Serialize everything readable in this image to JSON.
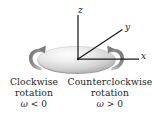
{
  "figure": {
    "background_color": "#ffffff",
    "width": 154,
    "height": 119
  },
  "diagram": {
    "disk": {
      "name": "rotating-disk",
      "fill_light": "#fbfbfb",
      "fill_mid": "#d8d8d8",
      "fill_dark": "#9a9a9a",
      "shadow_color": "#b4b4b4"
    },
    "axes": [
      {
        "id": "z",
        "label": "z",
        "direction": "up"
      },
      {
        "id": "y",
        "label": "y",
        "direction": "up-right"
      },
      {
        "id": "x",
        "label": "x",
        "direction": "right"
      }
    ],
    "axis_color": "#1a1a1a",
    "arrows": [
      {
        "id": "left",
        "name": "clockwise-rotation-arrow",
        "color": "#8c8c8c"
      },
      {
        "id": "right",
        "name": "counterclockwise-rotation-arrow",
        "color": "#8c8c8c"
      }
    ]
  },
  "caption": {
    "clockwise": {
      "line1": "Clockwise",
      "line2": "rotation",
      "symbol": "ω",
      "relation": "<",
      "value": "0"
    },
    "counterclockwise": {
      "line1": "Counterclockwise",
      "line2": "rotation",
      "symbol": "ω",
      "relation": ">",
      "value": "0"
    },
    "text_color": "#231f20"
  }
}
